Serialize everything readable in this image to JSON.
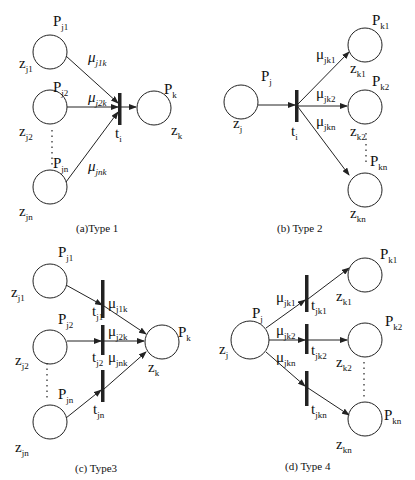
{
  "figure": {
    "panels": [
      {
        "caption": "(a)Type 1",
        "input_places": [
          {
            "p": "P",
            "p_sub": "j1",
            "z": "z",
            "z_sub": "j1",
            "arc": "μ",
            "arc_sub": "j1k"
          },
          {
            "p": "P",
            "p_sub": "j2",
            "z": "z",
            "z_sub": "j2",
            "arc": "μ",
            "arc_sub": "j2k"
          },
          {
            "p": "P",
            "p_sub": "jn",
            "z": "z",
            "z_sub": "jn",
            "arc": "μ",
            "arc_sub": "jnk"
          }
        ],
        "transition": {
          "t": "t",
          "t_sub": "i"
        },
        "output_places": [
          {
            "p": "P",
            "p_sub": "k",
            "z": "z",
            "z_sub": "k"
          }
        ]
      },
      {
        "caption": "(b) Type 2",
        "input_places": [
          {
            "p": "P",
            "p_sub": "j",
            "z": "z",
            "z_sub": "j"
          }
        ],
        "transition": {
          "t": "t",
          "t_sub": "i"
        },
        "output_places": [
          {
            "p": "P",
            "p_sub": "k1",
            "z": "z",
            "z_sub": "k1",
            "arc": "μ",
            "arc_sub": "jk1"
          },
          {
            "p": "P",
            "p_sub": "k2",
            "z": "z",
            "z_sub": "k2",
            "arc": "μ",
            "arc_sub": "jk2"
          },
          {
            "p": "P",
            "p_sub": "kn",
            "z": "z",
            "z_sub": "kn",
            "arc": "μ",
            "arc_sub": "jkn"
          }
        ]
      },
      {
        "caption": "(c) Type3",
        "input_places": [
          {
            "p": "P",
            "p_sub": "j1",
            "z": "z",
            "z_sub": "j1",
            "t": "t",
            "t_sub": "j1",
            "arc": "μ",
            "arc_sub": "j1k"
          },
          {
            "p": "P",
            "p_sub": "j2",
            "z": "z",
            "z_sub": "j2",
            "t": "t",
            "t_sub": "j2",
            "arc": "μ",
            "arc_sub": "j2k"
          },
          {
            "p": "P",
            "p_sub": "jn",
            "z": "z",
            "z_sub": "jn",
            "t": "t",
            "t_sub": "jn",
            "arc": "μ",
            "arc_sub": "jnk"
          }
        ],
        "output_places": [
          {
            "p": "P",
            "p_sub": "k",
            "z": "z",
            "z_sub": "k"
          }
        ]
      },
      {
        "caption": "(d) Type 4",
        "input_places": [
          {
            "p": "P",
            "p_sub": "j",
            "z": "z",
            "z_sub": "j"
          }
        ],
        "output_places": [
          {
            "p": "P",
            "p_sub": "k1",
            "z": "z",
            "z_sub": "k1",
            "t": "t",
            "t_sub": "jk1",
            "arc": "μ",
            "arc_sub": "jk1"
          },
          {
            "p": "P",
            "p_sub": "k2",
            "z": "z",
            "z_sub": "k2",
            "t": "t",
            "t_sub": "jk2",
            "arc": "μ",
            "arc_sub": "jk2"
          },
          {
            "p": "P",
            "p_sub": "kn",
            "z": "z",
            "z_sub": "kn",
            "t": "t",
            "t_sub": "jkn",
            "arc": "μ",
            "arc_sub": "jkn"
          }
        ]
      }
    ],
    "colors": {
      "stroke": "#222222",
      "text": "#111111",
      "background": "#ffffff"
    }
  }
}
